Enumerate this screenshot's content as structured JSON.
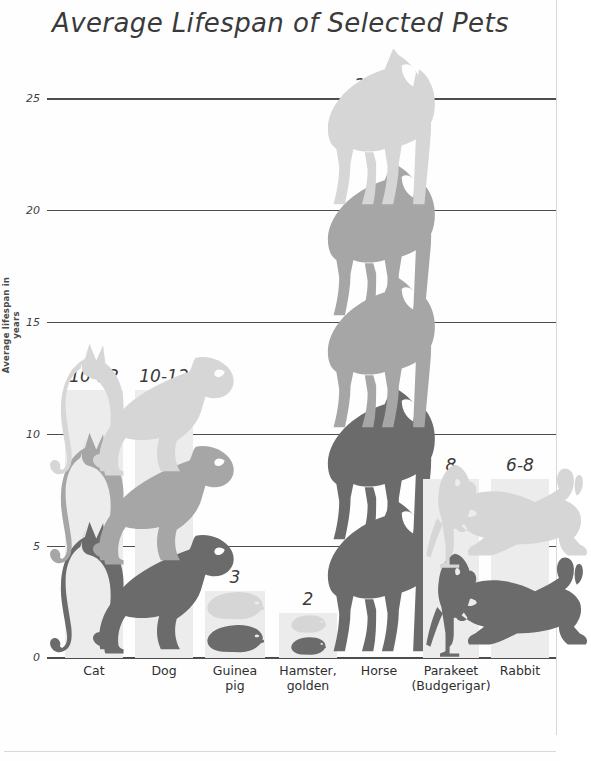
{
  "chart_data": {
    "type": "bar",
    "title": "Average Lifespan of Selected Pets",
    "xlabel": "",
    "ylabel": "Average lifespan in years",
    "ylim": [
      0,
      25
    ],
    "yticks": [
      0,
      5,
      10,
      15,
      20,
      25
    ],
    "ytick_labels": [
      "0",
      "5",
      "10",
      "15",
      "20",
      "25"
    ],
    "grid": true,
    "legend": "none",
    "categories": [
      "Cat",
      "Dog",
      "Guinea pig",
      "Hamster, golden",
      "Horse",
      "Parakeet (Budgerigar)",
      "Rabbit"
    ],
    "values": [
      12,
      12,
      3,
      2,
      25,
      8,
      8
    ],
    "value_labels": [
      "10-12",
      "10-12",
      "3",
      "2",
      "20-25",
      "8",
      "6-8"
    ],
    "ranges": [
      {
        "category": "Cat",
        "low": 10,
        "high": 12
      },
      {
        "category": "Dog",
        "low": 10,
        "high": 12
      },
      {
        "category": "Guinea pig",
        "low": 3,
        "high": 3
      },
      {
        "category": "Hamster, golden",
        "low": 2,
        "high": 2
      },
      {
        "category": "Horse",
        "low": 20,
        "high": 25
      },
      {
        "category": "Parakeet (Budgerigar)",
        "low": 8,
        "high": 8
      },
      {
        "category": "Rabbit",
        "low": 6,
        "high": 8
      }
    ]
  },
  "axis": {
    "yticks": [
      {
        "label": "25",
        "value": 25
      },
      {
        "label": "20",
        "value": 20
      },
      {
        "label": "15",
        "value": 15
      },
      {
        "label": "10",
        "value": 10
      },
      {
        "label": "5",
        "value": 5
      },
      {
        "label": "0",
        "value": 0
      }
    ],
    "ylabel": "Average lifespan in years"
  },
  "xaxis": {
    "ticks": [
      {
        "line1": "Cat",
        "line2": ""
      },
      {
        "line1": "Dog",
        "line2": ""
      },
      {
        "line1": "Guinea",
        "line2": "pig"
      },
      {
        "line1": "Hamster,",
        "line2": "golden"
      },
      {
        "line1": "Horse",
        "line2": ""
      },
      {
        "line1": "Parakeet",
        "line2": "(Budgerigar)"
      },
      {
        "line1": "Rabbit",
        "line2": ""
      }
    ]
  },
  "bars": [
    {
      "name": "cat",
      "icon": "cat-icon",
      "label": "10-12"
    },
    {
      "name": "dog",
      "icon": "dog-icon",
      "label": "10-12"
    },
    {
      "name": "guinea-pig",
      "icon": "guinea-pig-icon",
      "label": "3"
    },
    {
      "name": "hamster",
      "icon": "hamster-icon",
      "label": "2"
    },
    {
      "name": "horse",
      "icon": "horse-icon",
      "label": "20-25"
    },
    {
      "name": "parakeet",
      "icon": "parakeet-icon",
      "label": "8"
    },
    {
      "name": "rabbit",
      "icon": "rabbit-icon",
      "label": "6-8"
    }
  ],
  "title": "Average Lifespan of Selected Pets",
  "colors": {
    "bar_background": "#ececec",
    "gridline": "#4d4d4d",
    "text": "#3a3a3a",
    "icon_light": "#d4d4d4",
    "icon_mid": "#a8a8a8",
    "icon_dark": "#6e6e6e"
  }
}
